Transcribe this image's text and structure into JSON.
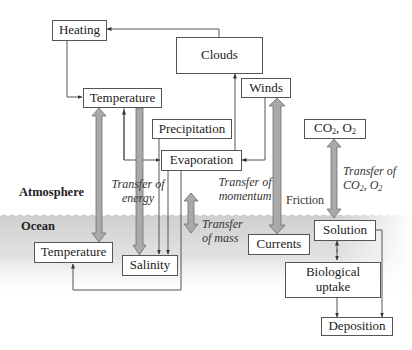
{
  "diagram": {
    "regions": {
      "atmosphere": "Atmosphere",
      "ocean": "Ocean"
    },
    "boxes": {
      "heating": "Heating",
      "clouds": "Clouds",
      "temperature_atm": "Temperature",
      "precipitation": "Precipitation",
      "evaporation": "Evaporation",
      "winds": "Winds",
      "gases_atm": {
        "co": "CO",
        "co_sub": "2",
        "sep": ", O",
        "o_sub": "2"
      },
      "temperature_ocean": "Temperature",
      "salinity": "Salinity",
      "currents": "Currents",
      "solution": "Solution",
      "biological_uptake_line1": "Biological",
      "biological_uptake_line2": "uptake",
      "deposition": "Deposition"
    },
    "transfer_labels": {
      "energy_line1": "Transfer of",
      "energy_line2": "energy",
      "momentum_line1": "Transfer of",
      "momentum_line2": "momentum",
      "mass_line1": "Transfer",
      "mass_line2": "of mass",
      "gases_line1": "Transfer of",
      "gases_line2": {
        "co": "CO",
        "co_sub": "2",
        "sep": ", O",
        "o_sub": "2"
      },
      "friction": "Friction"
    },
    "colors": {
      "box_border": "#555555",
      "wide_arrow_fill": "#a9a9a9",
      "wide_arrow_stroke": "#6f6f6f",
      "line": "#555555",
      "ocean_band": "#d9d9d9"
    }
  }
}
